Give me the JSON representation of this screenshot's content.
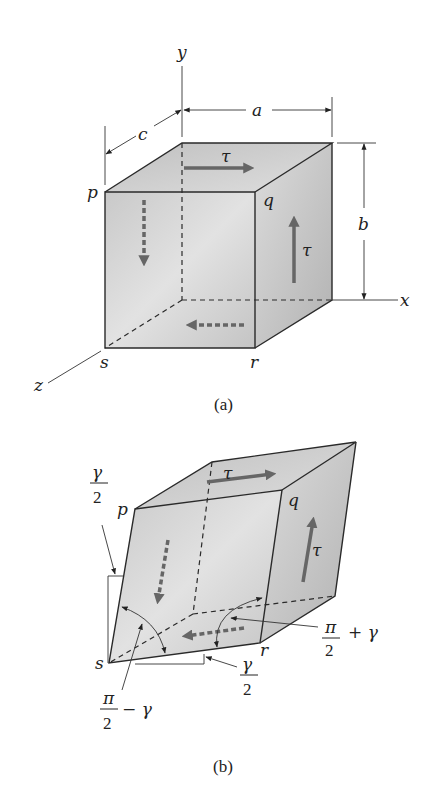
{
  "figure_a": {
    "caption": "(a)",
    "axes": {
      "x": "x",
      "y": "y",
      "z": "z"
    },
    "dimensions": {
      "a": "a",
      "b": "b",
      "c": "c"
    },
    "vertices": {
      "p": "p",
      "q": "q",
      "r": "r",
      "s": "s"
    },
    "stress_top": "τ",
    "stress_right": "τ"
  },
  "figure_b": {
    "caption": "(b)",
    "vertices": {
      "p": "p",
      "q": "q",
      "r": "r",
      "s": "s"
    },
    "stress_top": "τ",
    "stress_right": "τ",
    "angle_left_top": {
      "num": "γ",
      "den": "2"
    },
    "angle_bottom": {
      "num": "γ",
      "den": "2"
    },
    "angle_minus": {
      "num": "π",
      "den": "2",
      "suffix": "− γ"
    },
    "angle_plus": {
      "num": "π",
      "den": "2",
      "suffix": "+ γ"
    }
  },
  "colors": {
    "face_light": "#e6e6e6",
    "face_dark": "#b9b9b9",
    "stress_arrow": "#666666",
    "line": "#2a2a2a"
  }
}
